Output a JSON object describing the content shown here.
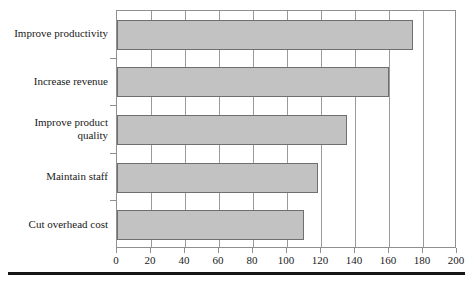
{
  "chart_data": {
    "type": "bar",
    "orientation": "horizontal",
    "title": "",
    "subtitle": "",
    "xlabel": "",
    "ylabel": "",
    "categories": [
      "Improve productivity",
      "Increase revenue",
      "Improve product\nquality",
      "Maintain staff",
      "Cut overhead cost"
    ],
    "values": [
      174,
      160,
      135,
      118,
      110
    ],
    "series": [
      {
        "name": "",
        "values": [
          174,
          160,
          135,
          118,
          110
        ]
      }
    ],
    "xlim": [
      0,
      200
    ],
    "xticks": [
      0,
      20,
      40,
      60,
      80,
      100,
      120,
      140,
      160,
      180,
      200
    ],
    "xtick_labels": [
      "0",
      "20",
      "40",
      "60",
      "80",
      "100",
      "120",
      "140",
      "160",
      "180",
      "200"
    ],
    "grid": "vertical",
    "legend": "none",
    "bar_color": "#c2c2c2",
    "bar_border_color": "#6f6f6f",
    "axis_color": "#8f8f8f",
    "text_color": "#1a1a1a"
  },
  "figure": {
    "caption_clipped": ""
  }
}
